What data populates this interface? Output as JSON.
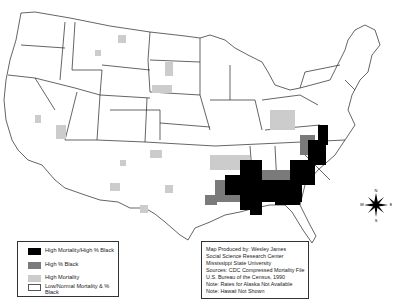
{
  "map": {
    "subject": "US county mortality and percent Black population",
    "colors": {
      "high_mortality_high_black": "#000000",
      "high_black": "#7a7a7a",
      "high_mortality": "#cccccc",
      "low_normal": "#ffffff",
      "boundary": "#222222"
    }
  },
  "legend": {
    "items": [
      {
        "label": "High Mortality/High % Black",
        "color": "#000000"
      },
      {
        "label": "High % Black",
        "color": "#7a7a7a"
      },
      {
        "label": "High Mortality",
        "color": "#cccccc"
      },
      {
        "label": "Low/Normal Mortality & % Black",
        "color": "#ffffff"
      }
    ]
  },
  "credits": {
    "lines": [
      "Map Produced by: Wesley James",
      "Social Science Research Center",
      "Mississippi State University",
      "Sources: CDC Compressed Mortality File",
      "U.S. Bureau of the Census, 1990",
      "Note: Rates for Alaska Not Available",
      "Note: Hawaii Not Shown"
    ]
  },
  "compass": {
    "n": "N",
    "s": "S",
    "e": "E",
    "w": "W"
  }
}
